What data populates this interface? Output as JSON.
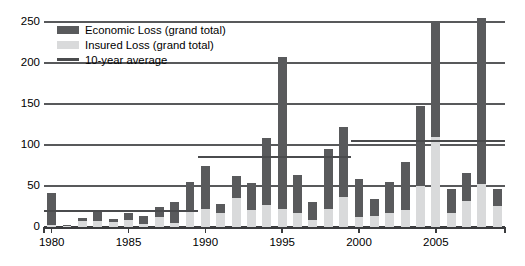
{
  "chart_data": {
    "type": "bar",
    "title": "",
    "subtitle": "",
    "xlabel": "",
    "ylabel": "",
    "ylim": [
      0,
      250
    ],
    "yticks": [
      0,
      50,
      100,
      150,
      200,
      250
    ],
    "xticks": [
      1980,
      1985,
      1990,
      1995,
      2000,
      2005
    ],
    "xtick_labels": [
      "1980",
      "1985",
      "1990",
      "1995",
      "2000",
      "2005"
    ],
    "grid": true,
    "legend_position": "top-left",
    "stacked": true,
    "categories": [
      1980,
      1981,
      1982,
      1983,
      1984,
      1985,
      1986,
      1987,
      1988,
      1989,
      1990,
      1991,
      1992,
      1993,
      1994,
      1995,
      1996,
      1997,
      1998,
      1999,
      2000,
      2001,
      2002,
      2003,
      2004,
      2005,
      2006,
      2007,
      2008,
      2009
    ],
    "series": [
      {
        "name": "Economic Loss (grand total)",
        "color": "#595a5c",
        "values": [
          42,
          3,
          11,
          18,
          10,
          17,
          13,
          24,
          31,
          55,
          75,
          28,
          62,
          54,
          108,
          207,
          63,
          30,
          95,
          122,
          58,
          34,
          55,
          79,
          148,
          250,
          46,
          66,
          255,
          46
        ]
      },
      {
        "name": "Insured Loss (grand total)",
        "color": "#d9dadb",
        "values": [
          2,
          1,
          7,
          7,
          6,
          8,
          4,
          12,
          5,
          20,
          22,
          17,
          35,
          21,
          27,
          22,
          17,
          8,
          22,
          37,
          12,
          13,
          17,
          21,
          50,
          110,
          17,
          32,
          52,
          26
        ]
      }
    ],
    "annotations": [
      {
        "name": "10-year average",
        "type": "step-line",
        "color": "#4a4b4d",
        "segments": [
          {
            "start": 1980,
            "end": 1989,
            "value": 20
          },
          {
            "start": 1990,
            "end": 1999,
            "value": 85
          },
          {
            "start": 2000,
            "end": 2009,
            "value": 105
          }
        ]
      }
    ]
  },
  "legend": {
    "items": [
      {
        "label": "Economic Loss (grand total)",
        "swatch": "eco"
      },
      {
        "label": "Insured Loss (grand total)",
        "swatch": "ins"
      },
      {
        "label": "10-year average",
        "swatch": "avg"
      }
    ]
  },
  "colors": {
    "economic": "#595a5c",
    "insured": "#d9dadb",
    "average": "#4a4b4d",
    "grid": "#58595b",
    "axis": "#3b3c3e",
    "background": "#ffffff"
  }
}
